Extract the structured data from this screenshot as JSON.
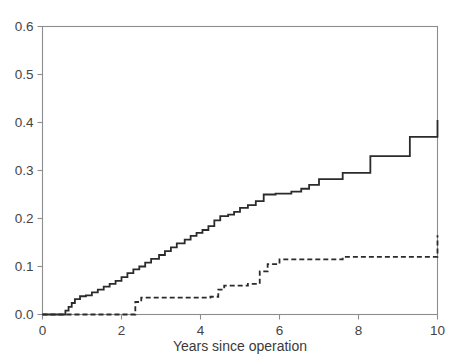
{
  "chart_data": {
    "type": "line",
    "title": "",
    "subtitle": "",
    "xlabel": "Years since operation",
    "ylabel": "",
    "xlim": [
      0,
      10
    ],
    "ylim": [
      0,
      0.6
    ],
    "xticks": [
      0,
      2,
      4,
      6,
      8,
      10
    ],
    "xticklabels": [
      "0",
      "2",
      "4",
      "6",
      "8",
      "10"
    ],
    "yticks": [
      0.0,
      0.1,
      0.2,
      0.3,
      0.4,
      0.5,
      0.6
    ],
    "yticklabels": [
      "0.0",
      "0.1",
      "0.2",
      "0.3",
      "0.4",
      "0.5",
      "0.6"
    ],
    "grid": false,
    "legend": "none",
    "frame": "box",
    "interpolation": "step-after",
    "series": [
      {
        "name": "solid-curve",
        "style": "solid",
        "color": "#2b2b2b",
        "width": 1.8,
        "final_value": 0.405,
        "x": [
          0.0,
          0.5,
          0.58,
          0.66,
          0.74,
          0.82,
          0.95,
          1.1,
          1.25,
          1.4,
          1.55,
          1.7,
          1.85,
          2.0,
          2.15,
          2.3,
          2.45,
          2.6,
          2.75,
          2.95,
          3.1,
          3.25,
          3.4,
          3.6,
          3.75,
          3.9,
          4.05,
          4.2,
          4.35,
          4.5,
          4.7,
          4.85,
          5.0,
          5.2,
          5.4,
          5.6,
          5.9,
          6.3,
          6.55,
          6.75,
          7.0,
          7.6,
          8.3,
          9.3,
          10.0
        ],
        "y": [
          0.0,
          0.0,
          0.008,
          0.016,
          0.024,
          0.032,
          0.038,
          0.04,
          0.046,
          0.052,
          0.058,
          0.064,
          0.07,
          0.078,
          0.086,
          0.094,
          0.1,
          0.108,
          0.116,
          0.124,
          0.132,
          0.14,
          0.148,
          0.156,
          0.164,
          0.17,
          0.176,
          0.184,
          0.196,
          0.205,
          0.208,
          0.214,
          0.222,
          0.228,
          0.236,
          0.25,
          0.252,
          0.256,
          0.262,
          0.27,
          0.282,
          0.295,
          0.33,
          0.37,
          0.405
        ]
      },
      {
        "name": "dashed-curve",
        "style": "dashed",
        "color": "#2b2b2b",
        "width": 1.8,
        "dash_pattern": "5,3",
        "final_value": 0.165,
        "x": [
          0.0,
          2.2,
          2.35,
          2.5,
          4.25,
          4.45,
          4.6,
          5.2,
          5.5,
          5.7,
          6.0,
          7.6,
          10.0
        ],
        "y": [
          0.0,
          0.0,
          0.026,
          0.035,
          0.037,
          0.052,
          0.06,
          0.064,
          0.09,
          0.105,
          0.115,
          0.12,
          0.165
        ]
      }
    ]
  }
}
